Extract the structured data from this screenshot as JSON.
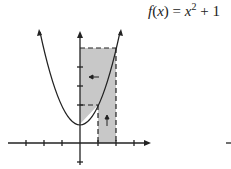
{
  "formula": {
    "func": "f",
    "var": "x",
    "eq": " = ",
    "base": "x",
    "exp": "2",
    "rest": " + 1"
  },
  "diagram": {
    "fill_color": "#c8c8c8",
    "line_color": "#222222",
    "origin_px": [
      80,
      143
    ],
    "unit_x_px": 18,
    "unit_y_px": 19,
    "x_ticks": [
      -3,
      -2,
      -1,
      1,
      2,
      3
    ],
    "y_ticks": [
      -1,
      1,
      2,
      3,
      4,
      5
    ],
    "curve": "x^2 + 1",
    "region": {
      "x_from": 1,
      "x_to": 2,
      "y_from": 2,
      "y_to": 5
    },
    "arrows": [
      {
        "dir": "left",
        "at": [
          0.5,
          3.5
        ]
      },
      {
        "dir": "up",
        "at": [
          1.5,
          1
        ]
      }
    ]
  }
}
